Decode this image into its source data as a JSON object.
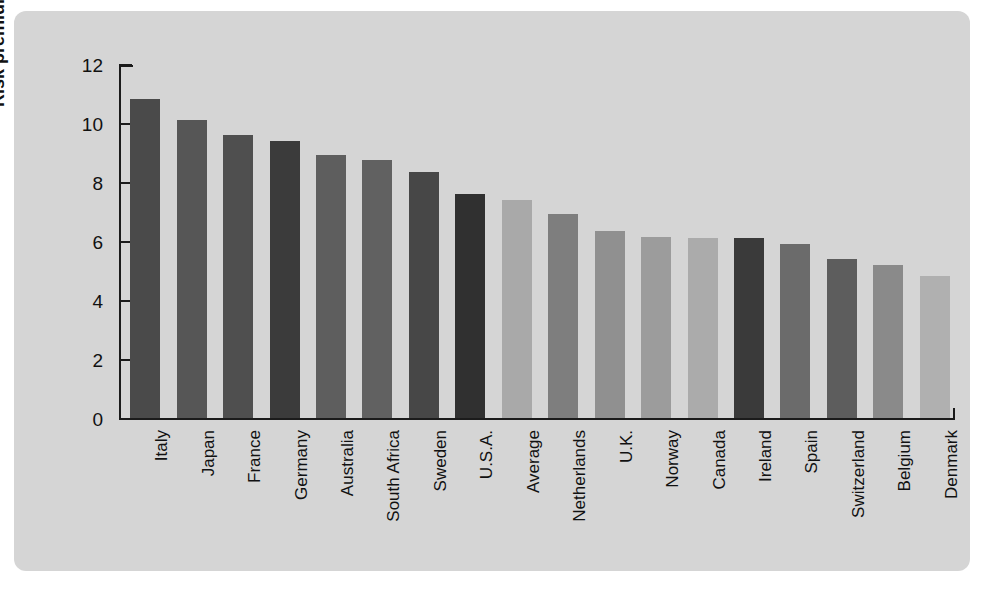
{
  "figure": {
    "background_color": "#ffffff",
    "panel_color": "#d5d5d5",
    "axis_color": "#1b1b1b"
  },
  "chart_data": {
    "type": "bar",
    "title": "",
    "xlabel": "",
    "ylabel": "Risk premium (%)",
    "ylim": [
      0,
      12
    ],
    "yticks": [
      0,
      2,
      4,
      6,
      8,
      10,
      12
    ],
    "ytick_labels": [
      "0",
      "2",
      "4",
      "6",
      "8",
      "10",
      "12"
    ],
    "grid": false,
    "legend": "none",
    "categories": [
      "Italy",
      "Japan",
      "France",
      "Germany",
      "Australia",
      "South Africa",
      "Sweden",
      "U.S.A.",
      "Average",
      "Netherlands",
      "U.K.",
      "Norway",
      "Canada",
      "Ireland",
      "Spain",
      "Switzerland",
      "Belgium",
      "Denmark"
    ],
    "values": [
      10.8,
      10.1,
      9.6,
      9.4,
      8.9,
      8.75,
      8.35,
      7.6,
      7.4,
      6.9,
      6.35,
      6.15,
      6.1,
      6.1,
      5.9,
      5.4,
      5.2,
      4.8
    ],
    "bar_colors": [
      "#4a4a4a",
      "#565656",
      "#4f4f4f",
      "#3b3b3b",
      "#5e5e5e",
      "#616161",
      "#474747",
      "#303030",
      "#a9a9a9",
      "#7e7e7e",
      "#909090",
      "#9c9c9c",
      "#ababab",
      "#3a3a3a",
      "#6b6b6b",
      "#5d5d5d",
      "#8a8a8a",
      "#b0b0b0"
    ]
  }
}
